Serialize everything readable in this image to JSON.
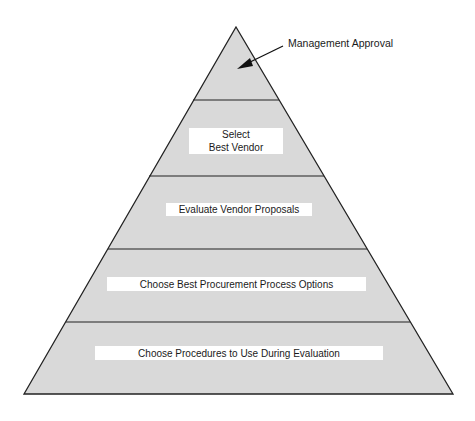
{
  "diagram": {
    "type": "pyramid",
    "colors": {
      "fill": "#d9d9d9",
      "stroke": "#222222",
      "label_bg": "#ffffff",
      "text": "#1a1a1a"
    },
    "callout": {
      "label": "Management Approval",
      "points_to_level": 1
    },
    "levels": [
      {
        "level": 1,
        "label_line1": "",
        "label_line2": "",
        "note": "apex (Management Approval)"
      },
      {
        "level": 2,
        "label_line1": "Select",
        "label_line2": "Best Vendor"
      },
      {
        "level": 3,
        "label_line1": "Evaluate Vendor Proposals"
      },
      {
        "level": 4,
        "label_line1": "Choose Best Procurement Process Options"
      },
      {
        "level": 5,
        "label_line1": "Choose Procedures to Use During Evaluation"
      }
    ]
  }
}
